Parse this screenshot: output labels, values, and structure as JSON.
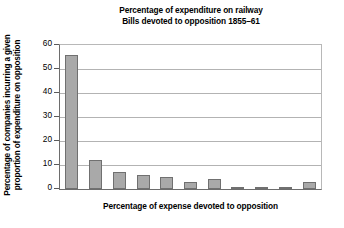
{
  "chart_data": {
    "type": "bar",
    "title": "Percentage of expenditure on railway Bills devoted to opposition 1855–61",
    "title_lines": [
      "Percentage of expenditure on railway",
      "Bills devoted to opposition 1855–61"
    ],
    "xlabel": "Percentage of expense devoted to opposition",
    "ylabel": "Percentage of companies incurring a given proportion of expenditure on opposition",
    "ylabel_lines": [
      "Percentage of companies incurring a given",
      "proportion of expenditure on opposition"
    ],
    "categories": [
      "",
      "",
      "",
      "",
      "",
      "",
      "",
      "",
      "",
      "",
      ""
    ],
    "values": [
      56,
      12,
      7,
      6,
      5,
      3,
      4,
      1,
      1,
      1,
      3
    ],
    "ylim": [
      0,
      60
    ],
    "ytick_labels": [
      "0",
      "10",
      "20",
      "30",
      "40",
      "50",
      "60"
    ],
    "ytick_values": [
      0,
      10,
      20,
      30,
      40,
      50,
      60
    ],
    "xtick_labels": [],
    "grid": "horizontal",
    "legend": "none",
    "bar_color": "#a9a9a9",
    "bar_border_color": "#707070",
    "gridline_color": "#b3b3b3",
    "axis_color": "#6d6d6d",
    "background_color": "#ffffff",
    "text_color": "#000000"
  }
}
